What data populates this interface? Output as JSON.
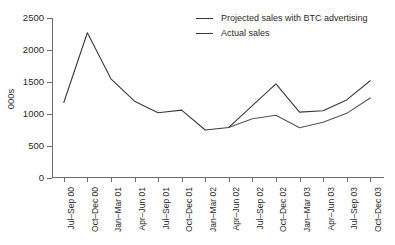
{
  "chart_data": {
    "type": "line",
    "title": "",
    "xlabel": "",
    "ylabel": "000s",
    "ylim": [
      0,
      2500
    ],
    "yticks": [
      0,
      500,
      1000,
      1500,
      2000,
      2500
    ],
    "grid": false,
    "legend_position": "top-right",
    "categories": [
      "Jul–Sep 00",
      "Oct–Dec 00",
      "Jan–Mar 01",
      "Apr–Jun 01",
      "Jul–Sep 01",
      "Oct–Dec 01",
      "Jan–Mar 02",
      "Apr–Jun 02",
      "Jul–Sep 02",
      "Oct–Dec 02",
      "Jan–Mar 03",
      "Apr–Jun 03",
      "Jul–Sep 03",
      "Oct–Dec 03"
    ],
    "series": [
      {
        "name": "Projected sales with BTC advertising",
        "color": "#555555",
        "values": [
          null,
          null,
          null,
          null,
          null,
          null,
          null,
          790,
          925,
          980,
          785,
          870,
          1010,
          1250
        ]
      },
      {
        "name": "Actual sales",
        "color": "#3a3a3a",
        "values": [
          1180,
          2270,
          1550,
          1200,
          1020,
          1060,
          750,
          790,
          1130,
          1470,
          1030,
          1050,
          1220,
          1520
        ]
      }
    ]
  },
  "legend": {
    "items": [
      {
        "label": "Projected sales with BTC advertising"
      },
      {
        "label": "Actual sales"
      }
    ]
  },
  "axis": {
    "y_label": "000s"
  }
}
